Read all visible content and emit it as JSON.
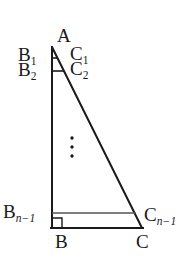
{
  "figure": {
    "background_color": "#ffffff",
    "stroke_color": "#1a1a1a",
    "secondary_stroke_color": "#555555",
    "label_color": "#1a1a1a",
    "vertices": {
      "A": {
        "x": 52,
        "y": 47
      },
      "B": {
        "x": 52,
        "y": 228
      },
      "C": {
        "x": 142,
        "y": 228
      }
    },
    "edges": [
      {
        "name": "leg-AB",
        "from": "A",
        "to": "B",
        "x1": 52,
        "y1": 47,
        "x2": 52,
        "y2": 228,
        "width": 2.0,
        "color": "#1a1a1a"
      },
      {
        "name": "base-BC",
        "from": "B",
        "to": "C",
        "x1": 52,
        "y1": 228,
        "x2": 142,
        "y2": 228,
        "width": 2.0,
        "color": "#1a1a1a"
      },
      {
        "name": "hypotenuse-AC",
        "from": "A",
        "to": "C",
        "x1": 52,
        "y1": 47,
        "x2": 142,
        "y2": 228,
        "width": 2.0,
        "color": "#1a1a1a"
      }
    ],
    "cross_segments": [
      {
        "name": "segment-B1-C1",
        "x1": 52,
        "y1": 58,
        "x2": 57,
        "y2": 58,
        "width": 1.6,
        "color": "#1a1a1a"
      },
      {
        "name": "segment-B2-C2",
        "x1": 52,
        "y1": 71,
        "x2": 64,
        "y2": 71,
        "width": 1.6,
        "color": "#1a1a1a"
      },
      {
        "name": "segment-Bn1-Cn1",
        "x1": 52,
        "y1": 213,
        "x2": 135,
        "y2": 213,
        "width": 1.3,
        "color": "#555555"
      }
    ],
    "right_angle_marker": {
      "name": "right-angle-at-B",
      "x": 52,
      "y": 228,
      "size": 10,
      "width": 1.4,
      "color": "#1a1a1a"
    },
    "ellipsis": {
      "name": "vertical-ellipsis",
      "x": 72,
      "y_start": 138,
      "spacing": 9,
      "count": 3,
      "radius": 1.7,
      "color": "#1a1a1a"
    },
    "labels": [
      {
        "id": "A",
        "base": "A",
        "sub": "",
        "sub_italic": false
      },
      {
        "id": "B1",
        "base": "B",
        "sub": "1",
        "sub_italic": false
      },
      {
        "id": "C1",
        "base": "C",
        "sub": "1",
        "sub_italic": false
      },
      {
        "id": "B2",
        "base": "B",
        "sub": "2",
        "sub_italic": false
      },
      {
        "id": "C2",
        "base": "C",
        "sub": "2",
        "sub_italic": false
      },
      {
        "id": "Bn1",
        "base": "B",
        "sub": "n−1",
        "sub_italic": true
      },
      {
        "id": "Cn1",
        "base": "C",
        "sub": "n−1",
        "sub_italic": true
      },
      {
        "id": "B",
        "base": "B",
        "sub": "",
        "sub_italic": false
      },
      {
        "id": "C",
        "base": "C",
        "sub": "",
        "sub_italic": false
      }
    ]
  }
}
